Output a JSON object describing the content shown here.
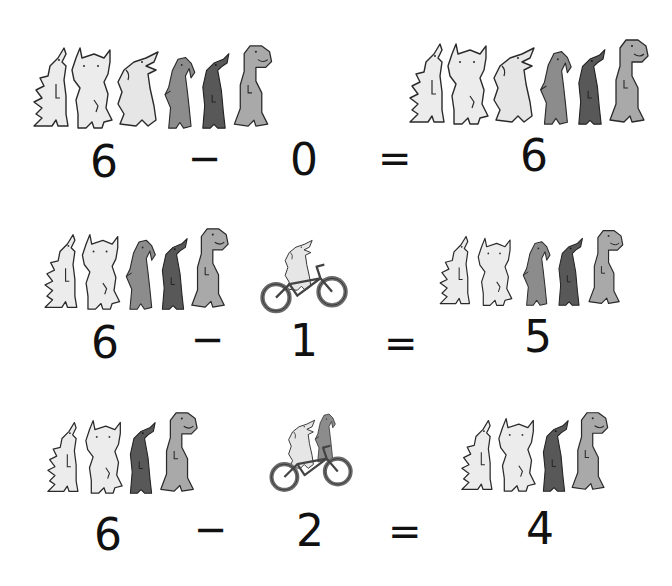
{
  "colors": {
    "outline": "#2a2a2a",
    "light": "#ececec",
    "light2": "#e4e4e4",
    "mid": "#8c8c8c",
    "dark": "#585858",
    "trex": "#a9a9a9",
    "wheel": "#6a6a6a"
  },
  "equations": [
    {
      "minuend": "6",
      "minus": "−",
      "subtrahend": "0",
      "equals": "=",
      "result": "6",
      "left_dinos": [
        "stegosaurus",
        "triceratops",
        "duckbill-light",
        "parrotbeak",
        "duckbill-dark",
        "trex"
      ],
      "leaving_dinos": [],
      "remaining_dinos": [
        "stegosaurus",
        "triceratops",
        "duckbill-light",
        "parrotbeak",
        "duckbill-dark",
        "trex"
      ]
    },
    {
      "minuend": "6",
      "minus": "−",
      "subtrahend": "1",
      "equals": "=",
      "result": "5",
      "left_dinos": [
        "stegosaurus",
        "triceratops",
        "parrotbeak",
        "duckbill-dark",
        "trex"
      ],
      "leaving_dinos": [
        "duckbill-light-on-bike"
      ],
      "remaining_dinos": [
        "stegosaurus",
        "triceratops",
        "parrotbeak",
        "duckbill-dark",
        "trex"
      ]
    },
    {
      "minuend": "6",
      "minus": "−",
      "subtrahend": "2",
      "equals": "=",
      "result": "4",
      "left_dinos": [
        "stegosaurus",
        "triceratops",
        "duckbill-dark",
        "trex"
      ],
      "leaving_dinos": [
        "duckbill-light-on-bike",
        "parrotbeak-on-bike"
      ],
      "remaining_dinos": [
        "stegosaurus",
        "triceratops",
        "duckbill-dark",
        "trex"
      ]
    }
  ]
}
